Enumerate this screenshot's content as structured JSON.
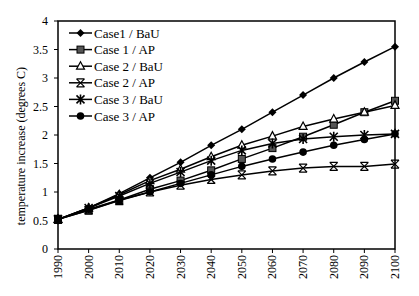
{
  "chart_data": {
    "type": "line",
    "title": "",
    "xlabel": "",
    "ylabel": "temperature increase (degrees C)",
    "x": [
      1990,
      2000,
      2010,
      2020,
      2030,
      2040,
      2050,
      2060,
      2070,
      2080,
      2090,
      2100
    ],
    "xticks": [
      "1990",
      "2000",
      "2010",
      "2020",
      "2030",
      "2040",
      "2050",
      "2060",
      "2070",
      "2080",
      "2090",
      "2100"
    ],
    "ylim": [
      0,
      4
    ],
    "yticks": [
      "0",
      "0.5",
      "1",
      "1.5",
      "2",
      "2.5",
      "3",
      "3.5",
      "4"
    ],
    "ytick_values": [
      0,
      0.5,
      1,
      1.5,
      2,
      2.5,
      3,
      3.5,
      4
    ],
    "grid": false,
    "legend_position": "upper-left-inside",
    "series": [
      {
        "name": "Case1 / BaU",
        "marker": "diamond",
        "values": [
          0.52,
          0.72,
          0.97,
          1.25,
          1.52,
          1.82,
          2.1,
          2.4,
          2.7,
          3.0,
          3.28,
          3.55
        ]
      },
      {
        "name": "Case 1 / AP",
        "marker": "square",
        "values": [
          0.52,
          0.68,
          0.86,
          1.05,
          1.2,
          1.38,
          1.58,
          1.77,
          1.97,
          2.18,
          2.4,
          2.6
        ]
      },
      {
        "name": "Case 2 / BaU",
        "marker": "triangle",
        "values": [
          0.52,
          0.72,
          0.95,
          1.2,
          1.4,
          1.62,
          1.82,
          1.98,
          2.15,
          2.28,
          2.4,
          2.52
        ]
      },
      {
        "name": "Case 2 / AP",
        "marker": "x",
        "values": [
          0.52,
          0.68,
          0.85,
          1.0,
          1.12,
          1.22,
          1.3,
          1.37,
          1.42,
          1.45,
          1.45,
          1.49
        ]
      },
      {
        "name": "Case 3 / BaU",
        "marker": "asterisk",
        "values": [
          0.52,
          0.72,
          0.93,
          1.15,
          1.35,
          1.55,
          1.73,
          1.85,
          1.93,
          1.97,
          2.0,
          2.02
        ]
      },
      {
        "name": "Case 3 / AP",
        "marker": "circle",
        "values": [
          0.52,
          0.7,
          0.86,
          1.0,
          1.15,
          1.3,
          1.45,
          1.58,
          1.7,
          1.82,
          1.92,
          2.02
        ]
      }
    ]
  },
  "colors": {
    "line": "#000000",
    "square_fill": "#555555",
    "background": "#ffffff"
  }
}
